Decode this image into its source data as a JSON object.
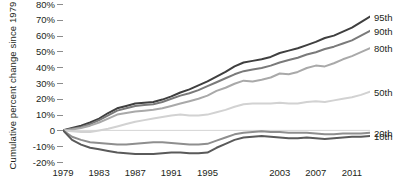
{
  "chart_data": {
    "type": "line",
    "title": "",
    "xlabel": "",
    "ylabel": "Cumulative percent change since 1979",
    "xlim": [
      1979,
      2013
    ],
    "ylim": [
      -20,
      80
    ],
    "grid": false,
    "legend_position": "right-end-labels",
    "y_ticks": [
      80,
      70,
      60,
      50,
      40,
      30,
      20,
      10,
      0,
      -10,
      -20
    ],
    "y_ticklabels": [
      "80%",
      "70%",
      "60%",
      "50%",
      "40%",
      "30%",
      "20%",
      "10%",
      "0",
      "-10%",
      "-20%"
    ],
    "x_ticks": [
      1979,
      1983,
      1987,
      1991,
      1995,
      2003,
      2007,
      2011
    ],
    "x_ticklabels": [
      "1979",
      "1983",
      "1987",
      "1991",
      "1995",
      "2003",
      "2007",
      "2011"
    ],
    "x": [
      1979,
      1980,
      1981,
      1982,
      1983,
      1984,
      1985,
      1986,
      1987,
      1988,
      1989,
      1990,
      1991,
      1992,
      1993,
      1994,
      1995,
      1996,
      1997,
      1998,
      1999,
      2000,
      2001,
      2002,
      2003,
      2004,
      2005,
      2006,
      2007,
      2008,
      2009,
      2010,
      2011,
      2012,
      2013
    ],
    "series": [
      {
        "name": "95th",
        "label": "95th",
        "color": "#3f3f3f",
        "values": [
          0,
          1.5,
          3,
          5,
          7.5,
          11,
          14,
          15.5,
          17,
          17.5,
          18,
          19.5,
          21.5,
          24,
          26,
          28.5,
          31,
          34,
          37,
          40.5,
          43,
          44,
          45,
          46.5,
          49,
          50.5,
          52,
          54,
          56,
          58.5,
          60,
          62.5,
          65,
          68.5,
          72
        ]
      },
      {
        "name": "90th",
        "label": "90th",
        "color": "#7a7a7a",
        "values": [
          0,
          1,
          2,
          4,
          6.5,
          9.5,
          12.5,
          14,
          15.5,
          16,
          16.5,
          18,
          20,
          22,
          23.5,
          25.5,
          28,
          30.5,
          33,
          35.5,
          37.5,
          38.5,
          39.5,
          41,
          43,
          44.5,
          46,
          48,
          49.5,
          51.5,
          53,
          55,
          57,
          60,
          63
        ]
      },
      {
        "name": "80th",
        "label": "80th",
        "color": "#a9a9a9",
        "values": [
          0,
          0.5,
          1.5,
          3,
          5,
          7.5,
          10,
          11,
          12,
          12.5,
          13,
          14,
          15.5,
          17,
          18.5,
          20,
          22,
          25,
          27,
          29.5,
          31.5,
          31,
          32,
          33.5,
          36,
          35.5,
          37,
          39.5,
          41,
          40.5,
          42.5,
          45,
          47,
          49.5,
          52
        ]
      },
      {
        "name": "50th",
        "label": "50th",
        "color": "#d2d2d2",
        "values": [
          0,
          -0.5,
          -1,
          -1,
          0,
          1,
          2.5,
          4,
          5.5,
          6.5,
          7.5,
          8.5,
          9.5,
          10,
          9.5,
          9.5,
          10,
          11.5,
          13,
          15,
          16.5,
          17,
          17,
          17,
          17.5,
          17,
          17,
          18,
          18.5,
          18,
          19,
          20,
          21,
          22.5,
          24.5
        ]
      },
      {
        "name": "20th",
        "label": "20th",
        "color": "#8e8e8e",
        "values": [
          0,
          -4,
          -6,
          -7.5,
          -8,
          -8.5,
          -9,
          -9,
          -8.5,
          -8,
          -7.5,
          -7.5,
          -8,
          -8.5,
          -9,
          -9,
          -8.5,
          -6.5,
          -4.5,
          -2.5,
          -1.5,
          -1,
          -0.5,
          -1,
          -1,
          -1.5,
          -1.5,
          -1.5,
          -2,
          -2.5,
          -2.5,
          -2,
          -2,
          -2,
          -1.5
        ]
      },
      {
        "name": "10th",
        "label": "10th",
        "color": "#5a5a5a",
        "values": [
          0,
          -6,
          -9,
          -11,
          -12,
          -13,
          -14,
          -14.5,
          -15,
          -15,
          -15,
          -14.5,
          -14,
          -14,
          -14.5,
          -14.5,
          -14,
          -11,
          -8.5,
          -6,
          -4.5,
          -4,
          -3.5,
          -4,
          -4.5,
          -5,
          -5,
          -4.5,
          -5,
          -5.5,
          -5,
          -4.5,
          -4,
          -4,
          -3.5
        ]
      }
    ]
  }
}
